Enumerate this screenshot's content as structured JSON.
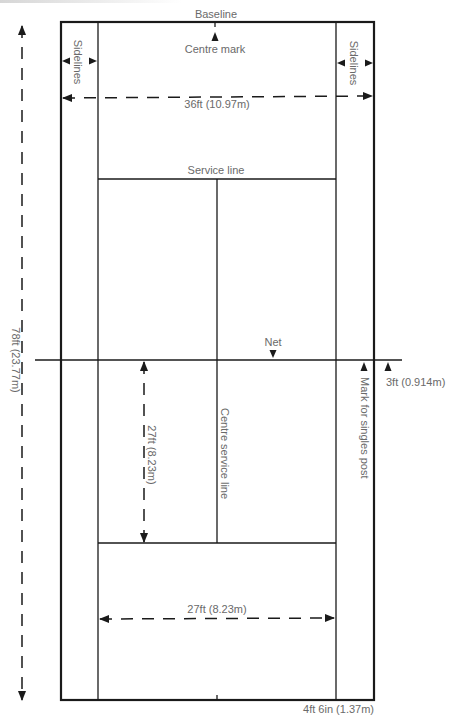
{
  "diagram": {
    "type": "tennis-court-dimensions",
    "colors": {
      "lines": "#1a1a1a",
      "labels": "#6a6a6a",
      "background": "#ffffff"
    },
    "labels": {
      "baseline": "Baseline",
      "centre_mark": "Centre mark",
      "overall_width": "36ft (10.97m)",
      "sidelines_left": "Sidelines",
      "sidelines_right": "Sidelines",
      "service_line": "Service line",
      "net": "Net",
      "overall_length": "78ft (23.77m)",
      "net_to_service": "27ft (8.23m)",
      "centre_service_line": "Centre service line",
      "singles_post_mark": "Mark for singles post",
      "post_offset": "3ft (0.914m)",
      "singles_width": "27ft (8.23m)",
      "alley_width": "4ft 6in (1.37m)"
    }
  }
}
